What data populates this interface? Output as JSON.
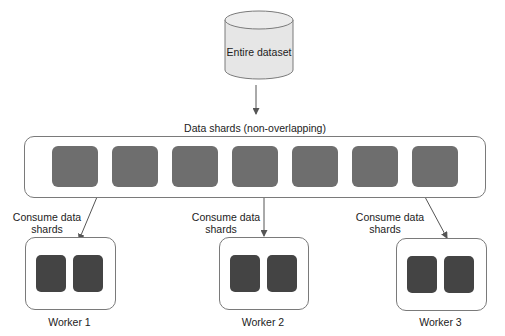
{
  "diagram": {
    "dataset": {
      "label": "Entire dataset"
    },
    "shards_container": {
      "label": "Data shards (non-overlapping)",
      "shard_count": 7
    },
    "edges": [
      {
        "from": "dataset",
        "to": "shards_container",
        "label": ""
      },
      {
        "from": "shards_container",
        "to": "worker_1",
        "label": "Consume data shards"
      },
      {
        "from": "shards_container",
        "to": "worker_2",
        "label": "Consume data shards"
      },
      {
        "from": "shards_container",
        "to": "worker_3",
        "label": "Consume data shards"
      }
    ],
    "workers": [
      {
        "id": "worker_1",
        "label": "Worker 1",
        "consume_line1": "Consume data",
        "consume_line2": "shards",
        "shard_count": 2
      },
      {
        "id": "worker_2",
        "label": "Worker 2",
        "consume_line1": "Consume data",
        "consume_line2": "shards",
        "shard_count": 2
      },
      {
        "id": "worker_3",
        "label": "Worker 3",
        "consume_line1": "Consume data",
        "consume_line2": "shards",
        "shard_count": 2
      }
    ],
    "colors": {
      "shard": "#6e6e6e",
      "worker_shard": "#444444",
      "cylinder_fill": "#e6e6e6",
      "stroke": "#7a7a7a"
    }
  }
}
